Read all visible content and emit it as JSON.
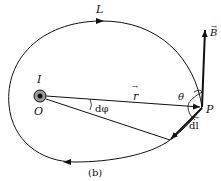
{
  "figure": {
    "caption": "(b)",
    "labels": {
      "loop": "L",
      "current": "I",
      "origin": "O",
      "point": "P",
      "field": "B",
      "radius": "r",
      "angle_theta": "θ",
      "angle_dphi": "dφ",
      "element": "dl"
    },
    "colors": {
      "stroke": "#111111",
      "wire_fill": "#9a9a9a",
      "wire_core": "#111111"
    }
  }
}
